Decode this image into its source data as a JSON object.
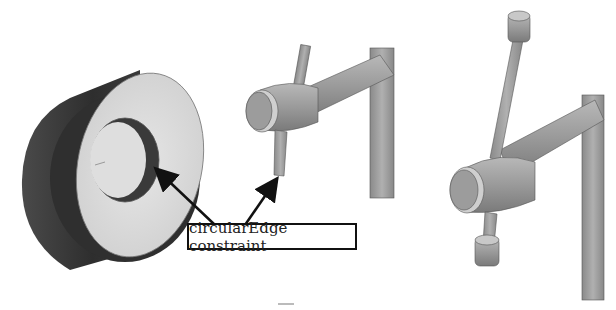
{
  "figure": {
    "callout_label": "circularEdge constraint",
    "panels": [
      {
        "name": "tube-part",
        "description": "Hollow cylinder (tube) with highlighted inner circular edge"
      },
      {
        "name": "clamp-assembly-partial",
        "description": "Clamp screw with handle pin, pin end circular edge highlighted"
      },
      {
        "name": "clamp-assembly-constrained",
        "description": "Clamp screw with handle pin fully inserted and end caps attached"
      }
    ],
    "colors": {
      "dark_shade": "#3a3a3a",
      "mid_shade": "#8c8c8c",
      "light_face": "#d9d9d9",
      "arrow": "#111111"
    }
  }
}
